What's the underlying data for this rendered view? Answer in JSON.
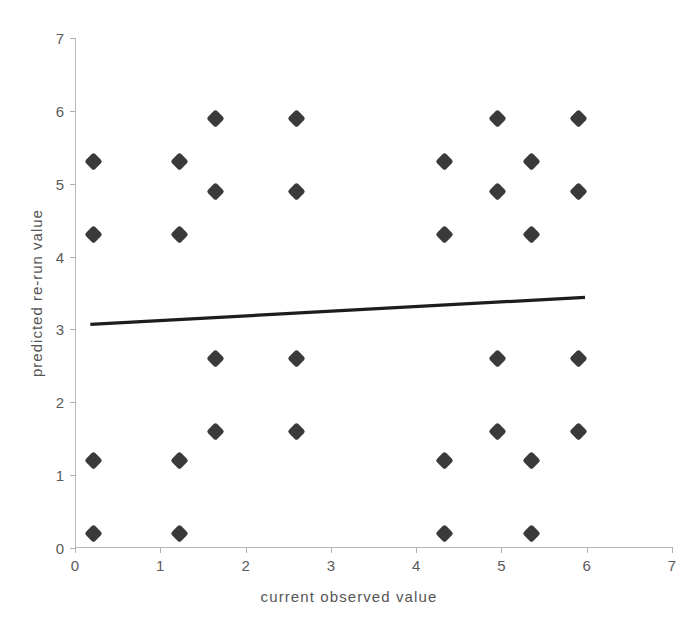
{
  "chart_data": {
    "type": "scatter",
    "title": "",
    "xlabel": "current  observed  value",
    "ylabel": "predicted  re-run  value",
    "xlim": [
      0,
      7
    ],
    "ylim": [
      0,
      7
    ],
    "xticks": [
      0,
      1,
      2,
      3,
      4,
      5,
      6,
      7
    ],
    "yticks": [
      0,
      1,
      2,
      3,
      4,
      5,
      6,
      7
    ],
    "xtick_labels": [
      "0",
      "1",
      "2",
      "3",
      "4",
      "5",
      "6",
      "7"
    ],
    "ytick_labels": [
      "0",
      "1",
      "2",
      "3",
      "4",
      "5",
      "6",
      "7"
    ],
    "grid": false,
    "legend": null,
    "marker_style": "diamond",
    "marker_color": "#3a3a3a",
    "axis_color": "#b8b8b8",
    "text_color": "#555555",
    "background_color": "#ffffff",
    "points": [
      {
        "x": 0.22,
        "y": 5.3
      },
      {
        "x": 0.22,
        "y": 4.3
      },
      {
        "x": 0.22,
        "y": 1.2
      },
      {
        "x": 0.22,
        "y": 0.2
      },
      {
        "x": 1.22,
        "y": 5.3
      },
      {
        "x": 1.22,
        "y": 4.3
      },
      {
        "x": 1.22,
        "y": 1.2
      },
      {
        "x": 1.22,
        "y": 0.2
      },
      {
        "x": 1.65,
        "y": 5.9
      },
      {
        "x": 1.65,
        "y": 4.9
      },
      {
        "x": 1.65,
        "y": 2.6
      },
      {
        "x": 1.65,
        "y": 1.6
      },
      {
        "x": 2.6,
        "y": 5.9
      },
      {
        "x": 2.6,
        "y": 4.9
      },
      {
        "x": 2.6,
        "y": 2.6
      },
      {
        "x": 2.6,
        "y": 1.6
      },
      {
        "x": 4.33,
        "y": 5.3
      },
      {
        "x": 4.33,
        "y": 4.3
      },
      {
        "x": 4.33,
        "y": 1.2
      },
      {
        "x": 4.33,
        "y": 0.2
      },
      {
        "x": 4.95,
        "y": 5.9
      },
      {
        "x": 4.95,
        "y": 4.9
      },
      {
        "x": 4.95,
        "y": 2.6
      },
      {
        "x": 4.95,
        "y": 1.6
      },
      {
        "x": 5.35,
        "y": 5.3
      },
      {
        "x": 5.35,
        "y": 4.3
      },
      {
        "x": 5.35,
        "y": 1.2
      },
      {
        "x": 5.35,
        "y": 0.2
      },
      {
        "x": 5.9,
        "y": 5.9
      },
      {
        "x": 5.9,
        "y": 4.9
      },
      {
        "x": 5.9,
        "y": 2.6
      },
      {
        "x": 5.9,
        "y": 1.6
      }
    ],
    "trendline": {
      "x0": 0.18,
      "y0": 3.07,
      "x1": 5.98,
      "y1": 3.44,
      "color": "#1d1d1d",
      "width": 3.2
    }
  }
}
